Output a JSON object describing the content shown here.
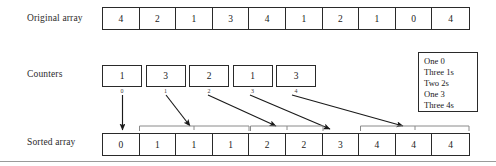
{
  "figure": {
    "rows": {
      "original": {
        "label": "Original array"
      },
      "counters": {
        "label": "Counters"
      },
      "sorted": {
        "label": "Sorted array"
      }
    }
  },
  "original_array": {
    "values": [
      "4",
      "2",
      "1",
      "3",
      "4",
      "1",
      "2",
      "1",
      "0",
      "4"
    ]
  },
  "counters": {
    "values": [
      "1",
      "3",
      "2",
      "1",
      "3"
    ],
    "indices": [
      "0",
      "1",
      "2",
      "3",
      "4"
    ]
  },
  "sorted_array": {
    "values": [
      "0",
      "1",
      "1",
      "1",
      "2",
      "2",
      "3",
      "4",
      "4",
      "4"
    ]
  },
  "legend": {
    "lines": [
      "One 0",
      "Three 1s",
      "Two 2s",
      "One 3",
      "Three 4s"
    ]
  },
  "colors": {
    "ink": "#1a1a1a",
    "border": "#2a2a2a",
    "bracket": "#8a8a8a",
    "rule": "#9a9a9a",
    "background": "#ffffff"
  }
}
